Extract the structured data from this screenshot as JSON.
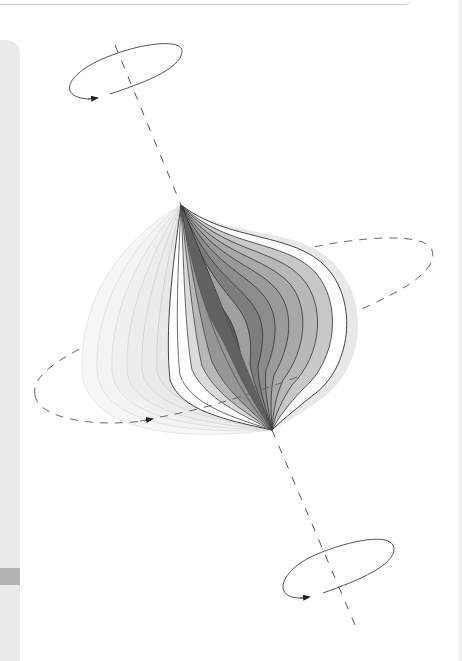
{
  "figure": {
    "elements": {
      "axis": {
        "style": "dashed",
        "color": "#555555"
      },
      "top_rotation_ellipse": {
        "style": "solid",
        "arrow": "counter-clockwise",
        "color": "#555555"
      },
      "bottom_rotation_ellipse": {
        "style": "solid",
        "arrow": "counter-clockwise",
        "color": "#555555"
      },
      "equatorial_ellipse": {
        "style": "dashed",
        "arrow": "right",
        "color": "#666666"
      },
      "dark_lobes": {
        "count": 9,
        "shades": [
          "#4a4a4a",
          "#5c5c5c",
          "#6e6e6e",
          "#7d7d7d",
          "#8c8c8c",
          "#9a9a9a",
          "#a8a8a8",
          "#b8b8b8",
          "#c8c8c8"
        ]
      },
      "light_lobes": {
        "count": 7,
        "shades": [
          "#f6f6f6",
          "#f3f3f3",
          "#f0f0f0",
          "#ededed",
          "#eaeaea",
          "#e7e7e7",
          "#e4e4e4"
        ]
      }
    }
  },
  "chrome": {
    "left_panel_color": "#eaeaea",
    "left_panel_band_color": "#b3b3b3",
    "top_rule_color": "#c8c8c8"
  }
}
